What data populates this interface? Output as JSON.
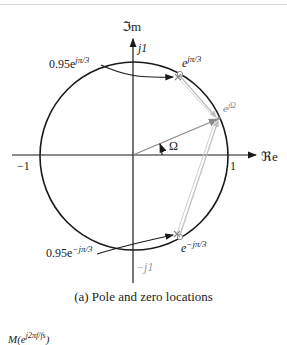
{
  "figure": {
    "axes": {
      "imag_label": "ℑm",
      "real_label": "ℜe",
      "j1_label": "j1",
      "neg_j1_label": "−j1",
      "one_label": "1",
      "neg_one_label": "−1"
    },
    "annotations": {
      "pole_upper": "0.95e",
      "pole_upper_exp": "jπ/3",
      "pole_lower": "0.95e",
      "pole_lower_exp": "−jπ/3",
      "zero_upper": "e",
      "zero_upper_exp": "jπ/3",
      "zero_lower": "e",
      "zero_lower_exp": "−jπ/3",
      "point_omega": "e",
      "point_omega_exp": "jΩ",
      "angle": "Ω"
    },
    "caption": "(a)  Pole and zero locations",
    "next_label": "M(e",
    "next_label_exp": "j2πf/fs",
    "next_label_close": ")"
  },
  "colors": {
    "ink": "#1a1a1a",
    "vector_gray": "#8a8a8a",
    "light_gray": "#bdbdbd"
  }
}
